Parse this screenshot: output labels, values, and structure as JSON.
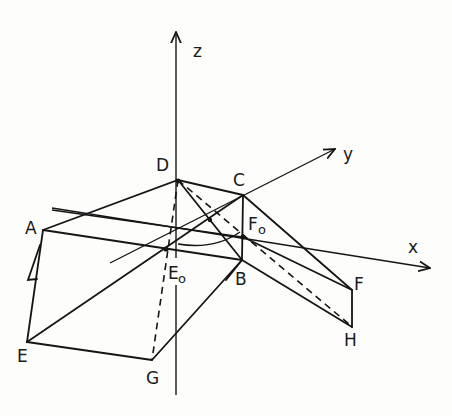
{
  "figure": {
    "type": "3D geometric construction (isometric sketch)",
    "axes": {
      "x": {
        "label": "x"
      },
      "y": {
        "label": "y"
      },
      "z": {
        "label": "z"
      }
    },
    "points": {
      "A": {
        "label": "A"
      },
      "B": {
        "label": "B"
      },
      "C": {
        "label": "C"
      },
      "D": {
        "label": "D"
      },
      "E": {
        "label": "E"
      },
      "F": {
        "label": "F"
      },
      "G": {
        "label": "G"
      },
      "H": {
        "label": "H"
      },
      "E0": {
        "label": "E",
        "subscript": "o"
      },
      "F0": {
        "label": "F",
        "subscript": "o"
      }
    },
    "colors": {
      "ink": "#151515",
      "paper": "#fdfdfb"
    }
  }
}
